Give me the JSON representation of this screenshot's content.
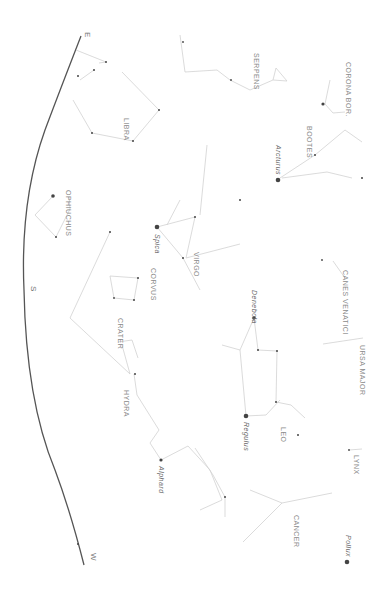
{
  "chart_title": "",
  "orientation": "rotated 90 degrees clockwise; horizon on left",
  "colors": {
    "background": "#ffffff",
    "horizon": "#555555",
    "lines": "#cfcfcf",
    "stars": "#333333",
    "labels": "#8a8a8a"
  },
  "horizon": {
    "directions": [
      {
        "label": "E",
        "x": 82,
        "y": 37
      },
      {
        "label": "S",
        "x": 33,
        "y": 290
      },
      {
        "label": "W",
        "x": 90,
        "y": 555
      }
    ]
  },
  "constellations": [
    {
      "name": "LIBRA",
      "x": 128,
      "y": 110
    },
    {
      "name": "OPHIUCHUS",
      "x": 70,
      "y": 190
    },
    {
      "name": "SERPENS",
      "x": 255,
      "y": 50
    },
    {
      "name": "CORONA BOR.",
      "x": 350,
      "y": 62
    },
    {
      "name": "BOOTES",
      "x": 312,
      "y": 125
    },
    {
      "name": "VIRGO",
      "x": 200,
      "y": 252
    },
    {
      "name": "CORVUS",
      "x": 155,
      "y": 268
    },
    {
      "name": "CRATER",
      "x": 122,
      "y": 318
    },
    {
      "name": "HYDRA",
      "x": 128,
      "y": 388
    },
    {
      "name": "CANES VENATICI",
      "x": 348,
      "y": 270
    },
    {
      "name": "URSA MAJOR",
      "x": 365,
      "y": 345
    },
    {
      "name": "LEO",
      "x": 285,
      "y": 425
    },
    {
      "name": "LYNX",
      "x": 358,
      "y": 455
    },
    {
      "name": "CANCER",
      "x": 298,
      "y": 515
    }
  ],
  "stars": [
    {
      "name": "Arcturus",
      "x": 278,
      "y": 180,
      "label_x": 282,
      "label_y": 145,
      "size": 4
    },
    {
      "name": "Spica",
      "x": 157,
      "y": 227,
      "label_x": 161,
      "label_y": 234,
      "size": 4
    },
    {
      "name": "Denebola",
      "x": 254,
      "y": 318,
      "label_x": 258,
      "label_y": 297,
      "size": 3
    },
    {
      "name": "Regulus",
      "x": 246,
      "y": 416,
      "label_x": 250,
      "label_y": 422,
      "size": 4
    },
    {
      "name": "Alphard",
      "x": 161,
      "y": 460,
      "label_x": 165,
      "label_y": 466,
      "size": 3
    },
    {
      "name": "Pollux",
      "x": 347,
      "y": 562,
      "label_x": 350,
      "label_y": 538,
      "size": 4
    }
  ]
}
